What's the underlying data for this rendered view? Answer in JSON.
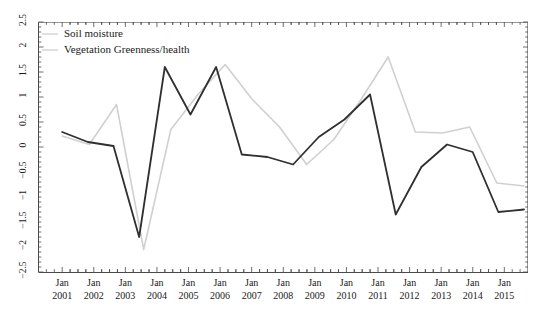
{
  "chart_data": {
    "type": "line",
    "title": "",
    "xlabel": "",
    "ylabel": "",
    "ylim": [
      -2.5,
      2.5
    ],
    "ytick_values": [
      -2.5,
      -2,
      -1.5,
      -1,
      -0.5,
      0,
      0.5,
      1,
      1.5,
      2,
      2.5
    ],
    "ytick_labels": [
      "−2.5",
      "−2",
      "−1.5",
      "−1",
      "−0.5",
      "0",
      "0.5",
      "1",
      "1.5",
      "2",
      "2.5"
    ],
    "grid": false,
    "legend_position": "top-left",
    "x": [
      2001,
      2002,
      2003,
      2004,
      2005,
      2006,
      2007,
      2008,
      2009,
      2010,
      2011,
      2012,
      2013,
      2014,
      2015
    ],
    "categories": [
      {
        "month": "Jan",
        "year": "2001"
      },
      {
        "month": "Jan",
        "year": "2002"
      },
      {
        "month": "Jan",
        "year": "2003"
      },
      {
        "month": "Jan",
        "year": "2004"
      },
      {
        "month": "Jan",
        "year": "2005"
      },
      {
        "month": "Jan",
        "year": "2006"
      },
      {
        "month": "Jan",
        "year": "2007"
      },
      {
        "month": "Jan",
        "year": "2008"
      },
      {
        "month": "Jan",
        "year": "2009"
      },
      {
        "month": "Jan",
        "year": "2010"
      },
      {
        "month": "Jan",
        "year": "2011"
      },
      {
        "month": "Jan",
        "year": "2012"
      },
      {
        "month": "Jan",
        "year": "2013"
      },
      {
        "month": "Jan",
        "year": "2014"
      },
      {
        "month": "Jan",
        "year": "2015"
      }
    ],
    "series": [
      {
        "name": "Soil moisture",
        "color": "#d0d0d0",
        "width": 1.6,
        "values": [
          0.22,
          0.05,
          0.85,
          -2.05,
          0.35,
          1.05,
          1.65,
          0.95,
          0.4,
          -0.35,
          -0.3,
          0.25,
          0.95,
          0.55,
          1.8
        ]
      },
      {
        "name": "Vegetation Greenness/health",
        "color": "#2f2f2f",
        "width": 1.8,
        "values": [
          0.3,
          0.1,
          0.02,
          -1.8,
          1.6,
          0.65,
          1.6,
          -0.15,
          -0.2,
          -0.35,
          0.2,
          0.55,
          1.05,
          -1.35,
          -0.4
        ]
      }
    ],
    "note_series_mapping": [
      "The light gray polyline is drawn for the full 2001-2015 span including the later 2011-2015 portion.",
      "The dark polyline is drawn for the full 2001-2015 span."
    ],
    "gray_values_full": [
      0.22,
      0.05,
      0.85,
      -2.05,
      0.35,
      1.05,
      1.65,
      0.95,
      0.4,
      -0.35,
      0.15,
      0.95,
      1.8,
      0.3,
      0.28,
      0.4,
      -0.72,
      -0.78
    ],
    "dark_values_full": [
      0.3,
      0.1,
      0.02,
      -1.8,
      1.6,
      0.65,
      1.6,
      -0.15,
      -0.2,
      -0.35,
      0.2,
      0.55,
      1.05,
      -1.35,
      -0.4,
      0.05,
      -0.1,
      -1.3,
      -1.25
    ]
  },
  "legend": {
    "items": [
      {
        "label": "Soil moisture",
        "swatch": "legend-swatch-soil-moisture"
      },
      {
        "label": "Vegetation Greenness/health",
        "swatch": "legend-swatch-vegetation"
      }
    ]
  },
  "axes": {
    "y_labels": [
      "2.5",
      "2",
      "1.5",
      "1",
      "0.5",
      "0",
      "−0.5",
      "−1",
      "−1.5",
      "−2",
      "−2.5"
    ],
    "x_month": "Jan",
    "x_years": [
      "2001",
      "2002",
      "2003",
      "2004",
      "2005",
      "2006",
      "2007",
      "2008",
      "2009",
      "2010",
      "2011",
      "2012",
      "2013",
      "2014",
      "2015"
    ]
  },
  "colors": {
    "dark_line": "#2f2f2f",
    "light_line": "#d9d9d9",
    "axis": "#4a4a4a",
    "text": "#1a1a1a",
    "background": "#ffffff"
  }
}
